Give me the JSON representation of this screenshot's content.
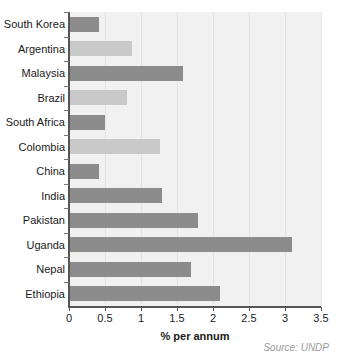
{
  "chart_data": {
    "type": "bar",
    "orientation": "horizontal",
    "title": "",
    "subtitle": "",
    "xlabel": "% per annum",
    "ylabel": "",
    "xlim": [
      0,
      3.5
    ],
    "xticks": [
      "0",
      "0.5",
      "1",
      "1.5",
      "2",
      "2.5",
      "3",
      "3.5"
    ],
    "xtick_values": [
      0,
      0.5,
      1,
      1.5,
      2,
      2.5,
      3,
      3.5
    ],
    "grid": true,
    "grid_axis": "x",
    "legend": null,
    "categories": [
      "South Korea",
      "Argentina",
      "Malaysia",
      "Brazil",
      "South Africa",
      "Colombia",
      "China",
      "India",
      "Pakistan",
      "Uganda",
      "Nepal",
      "Ethiopia"
    ],
    "values": [
      0.42,
      0.88,
      1.58,
      0.8,
      0.5,
      1.27,
      0.41,
      1.29,
      1.79,
      3.1,
      1.7,
      2.1
    ],
    "bar_shades": [
      "dark",
      "light",
      "dark",
      "light",
      "dark",
      "light",
      "dark",
      "dark",
      "dark",
      "dark",
      "dark",
      "dark"
    ],
    "annotations": [
      "Source: UNDP"
    ]
  },
  "figure": {
    "source_note": "Source: UNDP",
    "colors": {
      "bar_dark": "#8c8c8c",
      "bar_light": "#c9c9c9",
      "plot_background": "#f1f1f1",
      "gridline": "#e4e4e4",
      "axis": "#555555",
      "text": "#1a1a1a",
      "source_text": "#9a9a9a"
    }
  }
}
